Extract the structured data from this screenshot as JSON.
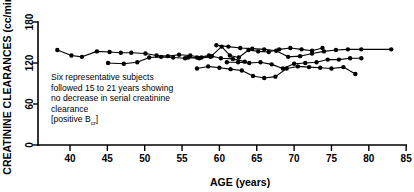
{
  "chart_data": {
    "type": "line",
    "title": "",
    "xlabel": "AGE (years)",
    "ylabel": "CREATININE CLEARANCES (cc/min)",
    "xlim": [
      35,
      85
    ],
    "ylim": [
      0,
      190
    ],
    "xticks": [
      40,
      45,
      50,
      55,
      60,
      65,
      70,
      75,
      80,
      85
    ],
    "yticks": [
      0,
      60,
      120,
      180
    ],
    "grid": false,
    "legend": "none",
    "marker": "filled-circle",
    "annotation": {
      "line1": "Six representative subjects",
      "line2": "followed 15 to 21 years showing",
      "line3": "no decrease in serial creatinine",
      "line4": "clearance",
      "line5_prefix": "[positive B",
      "line5_sub": "cr",
      "line5_suffix": "]"
    },
    "series": [
      {
        "name": "subject-1",
        "x": [
          38.3,
          40.2,
          41.6,
          43.6,
          45.3,
          46.8,
          48.2,
          50.1,
          51.6,
          53.1,
          54.6,
          56.1,
          57.6,
          59.0
        ],
        "y": [
          139,
          131,
          129,
          137,
          136,
          135,
          135,
          134,
          131,
          130,
          132,
          131,
          128,
          130
        ]
      },
      {
        "name": "subject-2",
        "x": [
          45.1,
          47.2,
          49.0,
          50.6,
          52.2,
          53.8,
          55.4,
          57.0,
          58.6,
          60.2,
          61.8,
          63.4
        ],
        "y": [
          120,
          119,
          121,
          128,
          129,
          128,
          127,
          128,
          131,
          127,
          126,
          122
        ]
      },
      {
        "name": "subject-3",
        "x": [
          55.8,
          57.3,
          58.8,
          60.3,
          61.4,
          62.6,
          63.9,
          65.2,
          66.6,
          68.0,
          69.5,
          71.0,
          72.4,
          73.8
        ],
        "y": [
          128,
          127,
          129,
          144,
          131,
          128,
          139,
          137,
          136,
          140,
          142,
          140,
          138,
          142
        ]
      },
      {
        "name": "subject-4",
        "x": [
          59.6,
          61.2,
          62.8,
          64.4,
          66.0,
          67.6,
          69.2,
          70.8,
          72.4,
          74.0,
          75.6,
          77.2,
          79.0,
          83.0
        ],
        "y": [
          146,
          144,
          142,
          141,
          140,
          138,
          129,
          130,
          134,
          137,
          139,
          140,
          140,
          140
        ]
      },
      {
        "name": "subject-5",
        "x": [
          61.0,
          62.5,
          64.0,
          65.5,
          67.0,
          68.5,
          70.0,
          71.5,
          73.0,
          74.5,
          76.0,
          77.5,
          79.0
        ],
        "y": [
          121,
          121,
          120,
          121,
          118,
          112,
          119,
          120,
          121,
          125,
          125,
          127,
          127
        ]
      },
      {
        "name": "subject-6",
        "x": [
          57.0,
          58.5,
          60.0,
          61.5,
          63.0,
          64.5,
          66.0,
          67.5,
          69.0,
          70.5,
          72.0,
          73.5,
          75.0,
          76.6,
          78.2
        ],
        "y": [
          112,
          115,
          113,
          111,
          109,
          101,
          98,
          100,
          112,
          115,
          114,
          113,
          112,
          114,
          104
        ]
      }
    ]
  }
}
